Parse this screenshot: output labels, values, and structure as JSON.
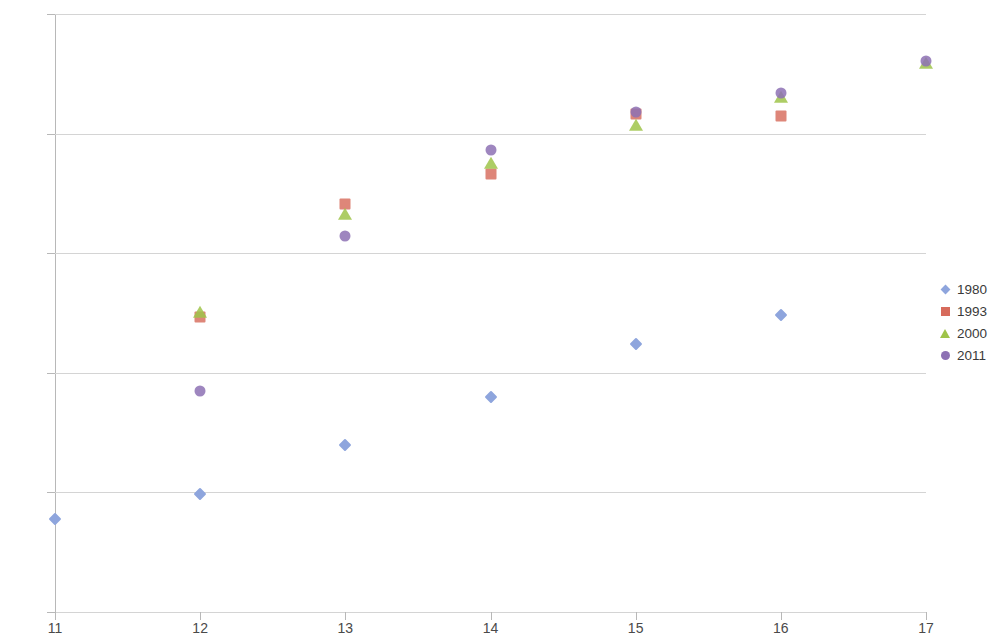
{
  "chart_data": {
    "type": "scatter",
    "title": "",
    "xlabel": "",
    "ylabel": "",
    "xlim": [
      11,
      17
    ],
    "ylim": [
      1.1,
      1.6
    ],
    "x_ticks": [
      "11",
      "12",
      "13",
      "14",
      "15",
      "16",
      "17"
    ],
    "y_ticks": [
      "1.1",
      "1.2",
      "1.3",
      "1.4",
      "1.5",
      "1.6"
    ],
    "grid": "horizontal",
    "legend_position": "right",
    "series": [
      {
        "name": "1980",
        "marker": "diamond",
        "color": "#8ea5dd",
        "x": [
          11,
          12,
          13,
          14,
          15,
          16
        ],
        "y": [
          1.178,
          1.199,
          1.24,
          1.28,
          1.324,
          1.348
        ]
      },
      {
        "name": "1993",
        "marker": "square",
        "color": "#d76b5c",
        "x": [
          12,
          13,
          14,
          15,
          16
        ],
        "y": [
          1.347,
          1.441,
          1.466,
          1.516,
          1.515
        ]
      },
      {
        "name": "2000",
        "marker": "triangle",
        "color": "#9fc44a",
        "x": [
          12,
          13,
          14,
          15,
          16,
          17
        ],
        "y": [
          1.35,
          1.432,
          1.475,
          1.506,
          1.53,
          1.558
        ]
      },
      {
        "name": "2011",
        "marker": "circle",
        "color": "#8d71b4",
        "x": [
          12,
          13,
          14,
          15,
          16,
          17
        ],
        "y": [
          1.285,
          1.414,
          1.486,
          1.518,
          1.534,
          1.561
        ]
      }
    ]
  }
}
